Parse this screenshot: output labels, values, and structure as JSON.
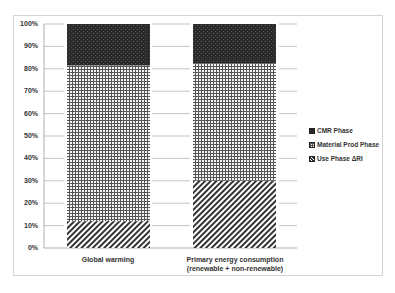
{
  "chart_data": {
    "type": "bar",
    "stacked": true,
    "normalized_percent": true,
    "title": "",
    "xlabel": "",
    "ylabel": "",
    "ylim": [
      0,
      100
    ],
    "y_ticks": [
      "0%",
      "10%",
      "20%",
      "30%",
      "40%",
      "50%",
      "60%",
      "70%",
      "80%",
      "90%",
      "100%"
    ],
    "categories": [
      "Global warming",
      "Primary energy consumption (renewable + non-renewable)"
    ],
    "category_label_lines": [
      [
        "Global warming"
      ],
      [
        "Primary energy consumption",
        "(renewable + non-renewable)"
      ]
    ],
    "series": [
      {
        "name": "Use Phase ΔRI",
        "values": [
          12,
          30
        ],
        "pattern": "diagonal-hatch"
      },
      {
        "name": "Material Prod Phase",
        "values": [
          69.5,
          52.5
        ],
        "pattern": "grid"
      },
      {
        "name": "CMR Phase",
        "values": [
          18.5,
          17.5
        ],
        "pattern": "dark-dotted"
      }
    ],
    "legend": {
      "position": "right",
      "entries": [
        "CMR Phase",
        "Material Prod Phase",
        "Use Phase ΔRI"
      ]
    },
    "grid": false
  },
  "legend": {
    "items": [
      {
        "label": "CMR Phase"
      },
      {
        "label": "Material Prod Phase"
      },
      {
        "label": "Use Phase ΔRI"
      }
    ]
  },
  "axis": {
    "ticks": [
      "0%",
      "10%",
      "20%",
      "30%",
      "40%",
      "50%",
      "60%",
      "70%",
      "80%",
      "90%",
      "100%"
    ]
  },
  "x_labels": {
    "cat0_line1": "Global warming",
    "cat1_line1": "Primary energy consumption",
    "cat1_line2": "(renewable + non-renewable)"
  }
}
